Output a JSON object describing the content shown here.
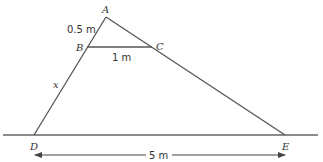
{
  "diagram": {
    "points": {
      "A": {
        "label": "A",
        "x": 106,
        "y": 17
      },
      "B": {
        "label": "B",
        "x": 87,
        "y": 47
      },
      "C": {
        "label": "C",
        "x": 152,
        "y": 47
      },
      "D": {
        "label": "D",
        "x": 34,
        "y": 135
      },
      "E": {
        "label": "E",
        "x": 285,
        "y": 135
      }
    },
    "measurements": {
      "AB": "0.5 m",
      "BC": "1 m",
      "BD": "x",
      "DE": "5 m"
    },
    "colors": {
      "line": "#555555",
      "text": "#333333"
    }
  }
}
